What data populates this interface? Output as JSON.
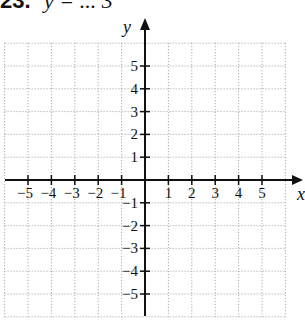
{
  "header": {
    "problem_number": "23.",
    "equation_partial": "y = ... 3"
  },
  "graph": {
    "x_axis_label": "x",
    "y_axis_label": "y",
    "x_tick_labels": [
      "−5",
      "−4",
      "−3",
      "−2",
      "−1",
      "1",
      "2",
      "3",
      "4",
      "5"
    ],
    "y_tick_labels": [
      "5",
      "4",
      "3",
      "2",
      "1",
      "−1",
      "−2",
      "−3",
      "−4",
      "−5"
    ],
    "x_range": [
      -6,
      6
    ],
    "y_range": [
      -6,
      6
    ],
    "grid": "dotted",
    "colors": {
      "axis": "#111111",
      "grid": "#9a9a9a",
      "background": "#ffffff"
    }
  }
}
